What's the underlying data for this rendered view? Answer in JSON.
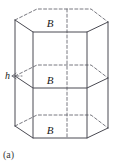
{
  "figure": {
    "caption": "(a)",
    "shape_name": "hexagonal-prism",
    "height_label": "h",
    "cross_section_labels": {
      "top": "B",
      "middle": "B",
      "bottom": "B"
    },
    "colors": {
      "solid_line": "#4a4a52",
      "hidden_line": "#6a6a72",
      "label_text": "#1a1a1a",
      "caption_text": "#3a3a3a",
      "background": "#ffffff"
    },
    "line_widths": {
      "solid": 1.0,
      "hidden": 0.9
    },
    "dash_pattern": "3,2.2",
    "geometry": {
      "description": "Right hexagonal prism drawn in oblique projection with three horizontal hexagonal cross-sections of equal area B (top face, mid cross-section, bottom face). Hidden back edges dashed.",
      "hex_front_apex_dx": 0,
      "hex_half_width": 47,
      "hex_shoulder_dx": 33,
      "hex_depth_y": 12,
      "center_x": 60,
      "top_front_y": 32,
      "mid_front_y": 88,
      "bottom_front_y": 138,
      "vertical_axis_x": 67
    },
    "vertices": {
      "top_hexagon": [
        [
          15,
          20
        ],
        [
          33,
          32
        ],
        [
          87,
          32
        ],
        [
          108,
          22
        ],
        [
          91,
          9
        ],
        [
          37,
          9
        ]
      ],
      "mid_hexagon": [
        [
          15,
          76
        ],
        [
          33,
          88
        ],
        [
          87,
          88
        ],
        [
          108,
          78
        ],
        [
          91,
          65
        ],
        [
          37,
          65
        ]
      ],
      "bottom_hexagon": [
        [
          15,
          126
        ],
        [
          33,
          138
        ],
        [
          87,
          138
        ],
        [
          108,
          128
        ],
        [
          91,
          115
        ],
        [
          37,
          115
        ]
      ]
    }
  }
}
